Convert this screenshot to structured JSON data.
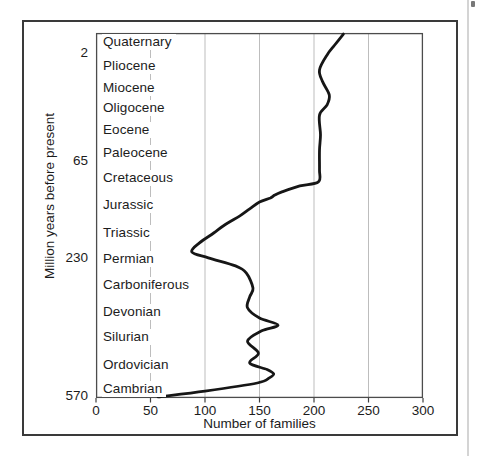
{
  "chart_data": {
    "type": "line",
    "xlabel": "Number of families",
    "ylabel": "Million years before present",
    "xlim": [
      0,
      300
    ],
    "x_ticks": [
      0,
      50,
      100,
      150,
      200,
      250,
      300
    ],
    "x_gridlines": [
      50,
      100,
      150,
      200,
      250
    ],
    "grid": "vertical-only",
    "legend": "none",
    "y_ticks": [
      {
        "label": "2",
        "frac": 0.055
      },
      {
        "label": "65",
        "frac": 0.351
      },
      {
        "label": "230",
        "frac": 0.617
      },
      {
        "label": "570",
        "frac": 0.995
      }
    ],
    "periods": [
      {
        "name": "Quaternary",
        "frac": 0.025
      },
      {
        "name": "Pliocene",
        "frac": 0.09
      },
      {
        "name": "Miocene",
        "frac": 0.151
      },
      {
        "name": "Oligocene",
        "frac": 0.206
      },
      {
        "name": "Eocene",
        "frac": 0.266
      },
      {
        "name": "Paleocene",
        "frac": 0.329
      },
      {
        "name": "Cretaceous",
        "frac": 0.397
      },
      {
        "name": "Jurassic",
        "frac": 0.471
      },
      {
        "name": "Triassic",
        "frac": 0.548
      },
      {
        "name": "Permian",
        "frac": 0.619
      },
      {
        "name": "Carboniferous",
        "frac": 0.69
      },
      {
        "name": "Devonian",
        "frac": 0.764
      },
      {
        "name": "Silurian",
        "frac": 0.833
      },
      {
        "name": "Ordovician",
        "frac": 0.91
      },
      {
        "name": "Cambrian",
        "frac": 0.975
      }
    ],
    "series": [
      {
        "name": "number-of-families-curve",
        "points": [
          [
            57,
            0.997
          ],
          [
            100,
            0.981
          ],
          [
            148,
            0.959
          ],
          [
            159,
            0.945
          ],
          [
            163,
            0.934
          ],
          [
            157,
            0.922
          ],
          [
            141,
            0.904
          ],
          [
            149,
            0.877
          ],
          [
            139,
            0.844
          ],
          [
            152,
            0.816
          ],
          [
            167,
            0.8
          ],
          [
            150,
            0.781
          ],
          [
            139,
            0.753
          ],
          [
            141,
            0.723
          ],
          [
            144,
            0.699
          ],
          [
            138,
            0.658
          ],
          [
            128,
            0.638
          ],
          [
            103,
            0.616
          ],
          [
            88,
            0.6
          ],
          [
            95,
            0.575
          ],
          [
            108,
            0.548
          ],
          [
            118,
            0.526
          ],
          [
            132,
            0.501
          ],
          [
            141,
            0.482
          ],
          [
            150,
            0.463
          ],
          [
            160,
            0.452
          ],
          [
            164,
            0.444
          ],
          [
            170,
            0.436
          ],
          [
            187,
            0.419
          ],
          [
            204,
            0.408
          ],
          [
            205,
            0.375
          ],
          [
            205,
            0.321
          ],
          [
            206,
            0.279
          ],
          [
            205,
            0.225
          ],
          [
            212,
            0.197
          ],
          [
            214,
            0.17
          ],
          [
            208,
            0.134
          ],
          [
            205,
            0.101
          ],
          [
            212,
            0.06
          ],
          [
            219,
            0.033
          ],
          [
            227,
            0.003
          ]
        ]
      }
    ],
    "style": {
      "line_color": "#161616",
      "grid_color": "#bdbdbd",
      "axis_color": "#4c4c4c",
      "tick_color": "#3f3f3f",
      "text_color": "#1c1c1c",
      "outer_border_color": "#3a3a3a"
    }
  }
}
